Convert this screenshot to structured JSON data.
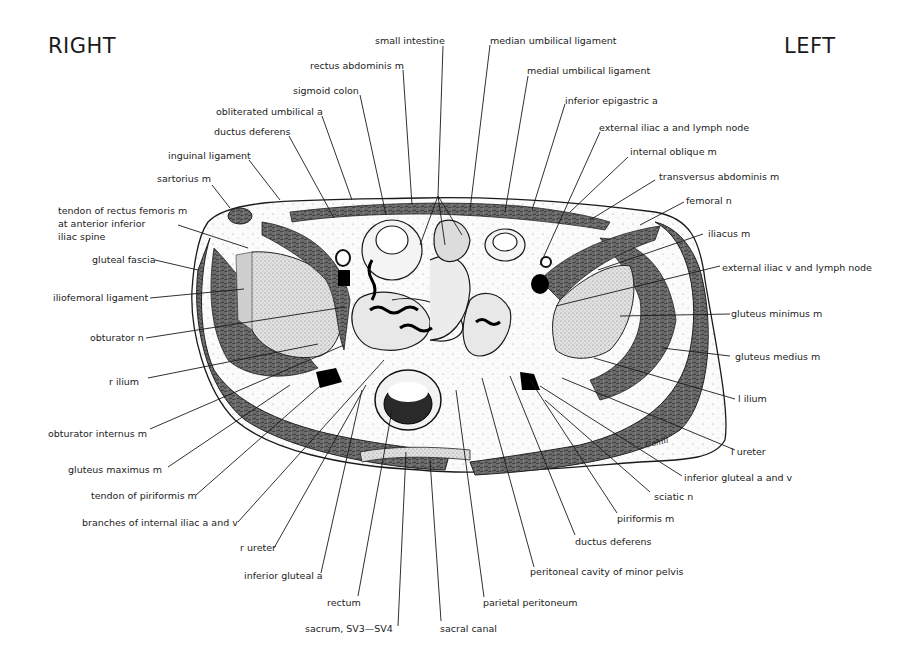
{
  "orientation": {
    "right_label": "RIGHT",
    "left_label": "LEFT"
  },
  "signature": "Cahill",
  "labels": {
    "small_intestine": "small intestine",
    "median_umbilical_ligament": "median umbilical ligament",
    "rectus_abdominis_m": "rectus abdominis m",
    "medial_umbilical_ligament": "medial umbilical ligament",
    "sigmoid_colon": "sigmoid colon",
    "inferior_epigastric_a": "inferior epigastric a",
    "obliterated_umbilical_a": "obliterated umbilical a",
    "external_iliac_a_lymph": "external iliac a and lymph node",
    "ductus_deferens_top": "ductus deferens",
    "internal_oblique_m": "internal oblique m",
    "inguinal_ligament": "inguinal ligament",
    "transversus_abdominis_m": "transversus abdominis m",
    "sartorius_m": "sartorius m",
    "femoral_n": "femoral n",
    "tendon_rectus_femoris": "tendon of rectus femoris m\nat anterior inferior\niliac spine",
    "iliacus_m": "iliacus m",
    "gluteal_fascia": "gluteal fascia",
    "external_iliac_v_lymph": "external iliac v and lymph node",
    "iliofemoral_ligament": "iliofemoral ligament",
    "gluteus_minimus_m": "gluteus minimus m",
    "obturator_n": "obturator n",
    "gluteus_medius_m": "gluteus medius m",
    "r_ilium": "r ilium",
    "l_ilium": "l ilium",
    "obturator_internus_m": "obturator internus m",
    "l_ureter": "l ureter",
    "gluteus_maximus_m": "gluteus maximus m",
    "inferior_gluteal_a_and_v": "inferior gluteal a and v",
    "tendon_of_piriformis_m": "tendon of piriformis m",
    "sciatic_n": "sciatic n",
    "branches_internal_iliac": "branches of internal iliac a and v",
    "piriformis_m": "piriformis m",
    "r_ureter": "r ureter",
    "ductus_deferens_bottom": "ductus deferens",
    "inferior_gluteal_a": "inferior gluteal a",
    "peritoneal_cavity_minor_pelvis": "peritoneal cavity of minor pelvis",
    "rectum": "rectum",
    "parietal_peritoneum": "parietal peritoneum",
    "sacrum": "sacrum, SV3—SV4",
    "sacral_canal": "sacral canal"
  },
  "colors": {
    "muscle": "#5a5a5a",
    "bone": "#d8d8d8",
    "line": "#1a1a1a",
    "background": "#ffffff"
  }
}
